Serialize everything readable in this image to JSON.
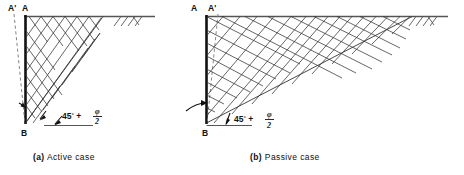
{
  "figure": {
    "panels": [
      {
        "key": "active",
        "caption_tag": "(a)",
        "caption_text": "Active case",
        "labels": {
          "wall_top": "A",
          "wall_top_deflected": "A'",
          "wall_base": "B"
        },
        "annotation": {
          "angle_value": "45",
          "degree_symbol": "°",
          "plus": "+",
          "phi": "φ",
          "divisor": "2",
          "full_text": "45° + φ/2"
        },
        "notes": {
          "deflection_direction": "away from backfill (A' left of A)",
          "wedge_angle_from_horizontal": "45 + phi/2",
          "failure_zone": "steep narrow wedge"
        }
      },
      {
        "key": "passive",
        "caption_tag": "(b)",
        "caption_text": "Passive case",
        "labels": {
          "wall_top": "A",
          "wall_top_deflected": "A'",
          "wall_base": "B"
        },
        "annotation": {
          "angle_value": "45",
          "degree_symbol": "°",
          "plus": "+",
          "phi": "φ",
          "divisor": "2",
          "full_text": "45° + φ/2"
        },
        "notes": {
          "deflection_direction": "into backfill (A' right of A)",
          "wedge_angle_from_horizontal": "45 - phi/2",
          "failure_zone": "shallow wide wedge"
        }
      }
    ],
    "symbols": {
      "ground_surface": "ground-line",
      "ground_hatching": "earth-hatch-icon",
      "wall": "retaining-wall",
      "deflected_wall": "deflected-wall-dashed",
      "slip_lines": "slip-line-mesh",
      "rotation_arrow": "wall-rotation-arrow"
    },
    "colors": {
      "line": "#111111",
      "mesh": "#333333",
      "ground": "#555555",
      "dashed": "#777777",
      "background": "#ffffff"
    }
  }
}
